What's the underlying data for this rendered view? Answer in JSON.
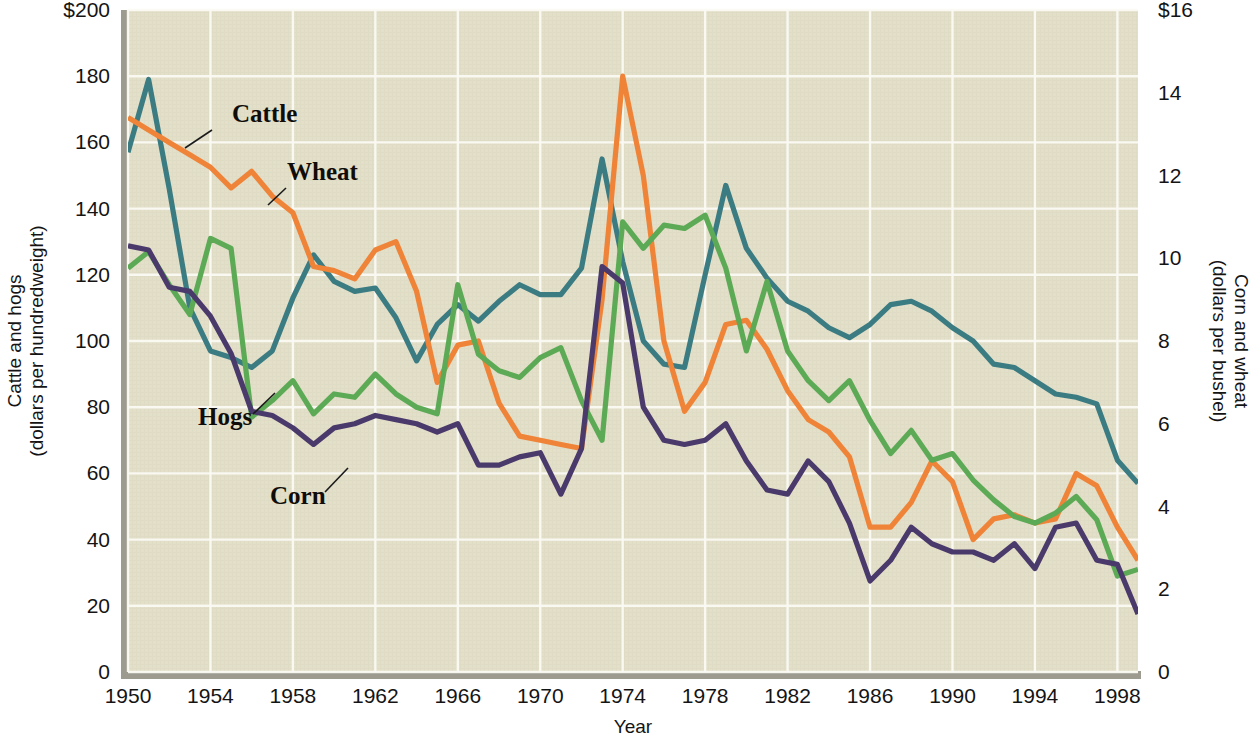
{
  "chart_data": {
    "type": "line",
    "title": "",
    "xlabel": "Year",
    "ylabel_left_line1": "Cattle and hogs",
    "ylabel_left_line2": "(dollars per hundredweight)",
    "ylabel_right_line1": "Corn and wheat",
    "ylabel_right_line2": "(dollars per bushel)",
    "grid": true,
    "legend_position": "inline-annotations",
    "xlim": [
      1950,
      1999
    ],
    "x_ticks": [
      1950,
      1954,
      1958,
      1962,
      1966,
      1970,
      1974,
      1978,
      1982,
      1986,
      1990,
      1994,
      1998
    ],
    "x_tick_labels": [
      "1950",
      "1954",
      "1958",
      "1962",
      "1966",
      "1970",
      "1974",
      "1978",
      "1982",
      "1986",
      "1990",
      "1994",
      "1998"
    ],
    "left_axis": {
      "ylim": [
        0,
        200
      ],
      "ticks": [
        0,
        20,
        40,
        60,
        80,
        100,
        120,
        140,
        160,
        180,
        200
      ],
      "tick_labels": [
        "0",
        "20",
        "40",
        "60",
        "80",
        "100",
        "120",
        "140",
        "160",
        "180",
        "$200"
      ],
      "units": "dollars per hundredweight"
    },
    "right_axis": {
      "ylim": [
        0,
        16
      ],
      "ticks": [
        0,
        2,
        4,
        6,
        8,
        10,
        12,
        14,
        16
      ],
      "tick_labels": [
        "0",
        "2",
        "4",
        "6",
        "8",
        "10",
        "12",
        "14",
        "$16"
      ],
      "units": "dollars per bushel"
    },
    "x": [
      1950,
      1951,
      1952,
      1953,
      1954,
      1955,
      1956,
      1957,
      1958,
      1959,
      1960,
      1961,
      1962,
      1963,
      1964,
      1965,
      1966,
      1967,
      1968,
      1969,
      1970,
      1971,
      1972,
      1973,
      1974,
      1975,
      1976,
      1977,
      1978,
      1979,
      1980,
      1981,
      1982,
      1983,
      1984,
      1985,
      1986,
      1987,
      1988,
      1989,
      1990,
      1991,
      1992,
      1993,
      1994,
      1995,
      1996,
      1997,
      1998,
      1999
    ],
    "series": [
      {
        "name": "Cattle",
        "color": "#3b7b82",
        "axis": "left",
        "units": "dollars per hundredweight",
        "values": [
          157,
          179,
          146,
          110,
          97,
          95,
          92,
          97,
          113,
          126,
          118,
          115,
          116,
          107,
          94,
          105,
          111,
          106,
          112,
          117,
          114,
          114,
          122,
          155,
          124,
          100,
          93,
          92,
          120,
          147,
          128,
          119,
          112,
          109,
          104,
          101,
          105,
          111,
          112,
          109,
          104,
          100,
          93,
          92,
          88,
          84,
          83,
          81,
          64,
          57
        ]
      },
      {
        "name": "Wheat",
        "color": "#ef8337",
        "axis": "right",
        "units": "dollars per bushel",
        "values": [
          13.4,
          13.1,
          12.8,
          12.5,
          12.2,
          11.7,
          12.1,
          11.5,
          11.1,
          9.8,
          9.7,
          9.5,
          10.2,
          10.4,
          9.2,
          7.0,
          7.9,
          8.0,
          6.5,
          5.7,
          5.6,
          5.5,
          5.4,
          9.0,
          14.4,
          12.0,
          8.0,
          6.3,
          7.0,
          8.4,
          8.5,
          7.8,
          6.8,
          6.1,
          5.8,
          5.2,
          3.5,
          3.5,
          4.1,
          5.1,
          4.6,
          3.2,
          3.7,
          3.8,
          3.6,
          3.7,
          4.8,
          4.5,
          3.5,
          2.7
        ]
      },
      {
        "name": "Hogs",
        "color": "#5caa55",
        "axis": "left",
        "units": "dollars per hundredweight",
        "values": [
          122,
          127,
          117,
          108,
          131,
          128,
          77,
          82,
          88,
          78,
          84,
          83,
          90,
          84,
          80,
          78,
          117,
          96,
          91,
          89,
          95,
          98,
          82,
          70,
          136,
          128,
          135,
          134,
          138,
          122,
          97,
          118,
          97,
          88,
          82,
          88,
          76,
          66,
          73,
          64,
          66,
          58,
          52,
          47,
          45,
          48,
          53,
          46,
          29,
          31
        ]
      },
      {
        "name": "Corn",
        "color": "#4a3a6b",
        "axis": "right",
        "units": "dollars per bushel",
        "values": [
          10.3,
          10.2,
          9.3,
          9.2,
          8.6,
          7.7,
          6.3,
          6.2,
          5.9,
          5.5,
          5.9,
          6.0,
          6.2,
          6.1,
          6.0,
          5.8,
          6.0,
          5.0,
          5.0,
          5.2,
          5.3,
          4.3,
          5.4,
          9.8,
          9.4,
          6.4,
          5.6,
          5.5,
          5.6,
          6.0,
          5.1,
          4.4,
          4.3,
          5.1,
          4.6,
          3.6,
          2.2,
          2.7,
          3.5,
          3.1,
          2.9,
          2.9,
          2.7,
          3.1,
          2.5,
          3.5,
          3.6,
          2.7,
          2.6,
          1.4
        ]
      }
    ],
    "annotations": [
      {
        "text": "Cattle",
        "label_x": 232,
        "label_y": 122,
        "leader": [
          212,
          130,
          185,
          148
        ]
      },
      {
        "text": "Wheat",
        "label_x": 287,
        "label_y": 180,
        "leader": [
          286,
          188,
          268,
          205
        ]
      },
      {
        "text": "Hogs",
        "label_x": 198,
        "label_y": 425,
        "leader": [
          253,
          414,
          275,
          393
        ]
      },
      {
        "text": "Corn",
        "label_x": 270,
        "label_y": 504,
        "leader": [
          325,
          492,
          348,
          468
        ]
      }
    ]
  },
  "colors": {
    "plot_background": "#e3dfc9",
    "gridline": "#fbfaf4",
    "page_background": "#ffffff",
    "border_shadow": "#9d9b90",
    "text": "#141414",
    "cattle": "#3b7b82",
    "wheat": "#ef8337",
    "hogs": "#5caa55",
    "corn": "#4a3a6b"
  }
}
